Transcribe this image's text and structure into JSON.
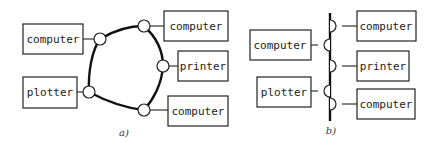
{
  "figure_a": {
    "caption": "a)",
    "topology": "ring",
    "nodes": [
      {
        "label": "computer",
        "side": "left"
      },
      {
        "label": "plotter",
        "side": "left"
      },
      {
        "label": "computer",
        "side": "right"
      },
      {
        "label": "printer",
        "side": "right"
      },
      {
        "label": "computer",
        "side": "right"
      }
    ]
  },
  "figure_b": {
    "caption": "b)",
    "topology": "bus",
    "nodes": [
      {
        "label": "computer",
        "side": "left"
      },
      {
        "label": "plotter",
        "side": "left"
      },
      {
        "label": "computer",
        "side": "right"
      },
      {
        "label": "printer",
        "side": "right"
      },
      {
        "label": "computer",
        "side": "right"
      }
    ]
  }
}
